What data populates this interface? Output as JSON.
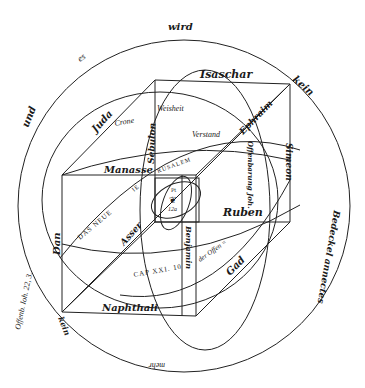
{
  "diagram": {
    "title": "",
    "background": "#ffffff",
    "ink": "#1a1a1a",
    "outer_ring_words": {
      "top": "wird",
      "upper_left_1": "es",
      "upper_left_2": "und",
      "upper_right": "kein",
      "right": "Bedeckel annectes",
      "bottom": "mehr",
      "left": "Offenb. Ioh. 22, 3.",
      "lower_left_corner": "kein"
    },
    "cube_labels": {
      "top_back_edge": "Isaschar",
      "top_left_edge": "Juda",
      "top_right_edge": "Ephraim",
      "front_top_edge": "Manasse",
      "back_left_vertical": "Sebulon",
      "right_back_vertical": "Simeon",
      "middle_right_edge": "Ruben",
      "left_front_vertical": "Dan",
      "bottom_front_edge": "Naphthali",
      "diagonal_lower_left": "Asser",
      "diagonal_lower_right": "Gad",
      "front_vertical": "Benjamin",
      "inner_vertical_right": "Offenbarung Joh."
    },
    "circle_labels": {
      "crown": "Crone",
      "wisdom": "Weisheit",
      "understanding": "Verstand",
      "new_jerusalem_1": "DAS NEUE",
      "new_jerusalem_2": "IE",
      "new_jerusalem_3": "RUSALEM",
      "chapter": "CAP XXI. 10",
      "der_offen": "der Offen ="
    },
    "center": {
      "top_label": "Pt",
      "symbol": "❦",
      "number": "12a"
    }
  }
}
